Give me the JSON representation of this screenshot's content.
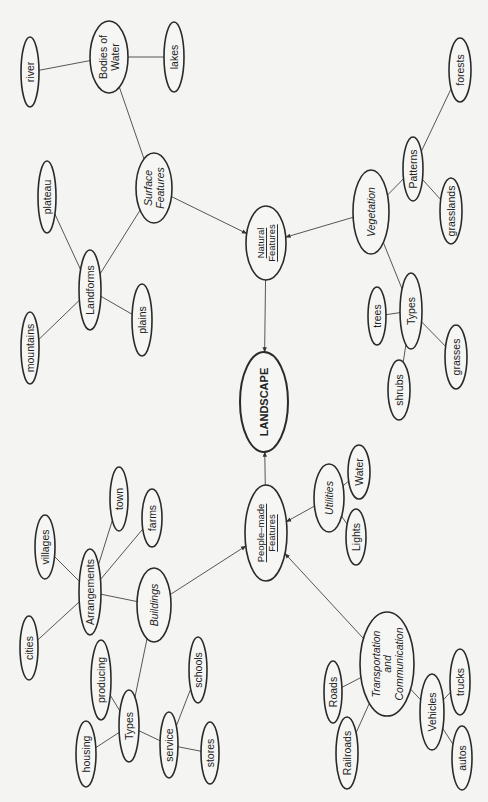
{
  "diagram": {
    "type": "concept-map",
    "root": "landscape",
    "nodes": [
      {
        "id": "landscape",
        "label": [
          "LANDSCAPE"
        ],
        "style": "bold",
        "cx": 264,
        "cy": 402,
        "rx": 24,
        "ry": 50
      },
      {
        "id": "natural",
        "label": [
          "Natural",
          "Features"
        ],
        "style": "sc",
        "cx": 266,
        "cy": 243,
        "rx": 20,
        "ry": 37
      },
      {
        "id": "peoplemade",
        "label": [
          "People–made",
          "Features"
        ],
        "style": "sc",
        "cx": 266,
        "cy": 533,
        "rx": 21,
        "ry": 48
      },
      {
        "id": "surface",
        "label": [
          "Surface",
          "Features"
        ],
        "style": "italic",
        "cx": 154,
        "cy": 188,
        "rx": 18,
        "ry": 35
      },
      {
        "id": "bodies",
        "label": [
          "Bodies of",
          "Water"
        ],
        "style": "normal",
        "cx": 109,
        "cy": 57,
        "rx": 19,
        "ry": 36
      },
      {
        "id": "river",
        "label": [
          "river"
        ],
        "style": "normal",
        "cx": 30,
        "cy": 72,
        "rx": 9,
        "ry": 35
      },
      {
        "id": "lakes",
        "label": [
          "lakes"
        ],
        "style": "normal",
        "cx": 174,
        "cy": 57,
        "rx": 10,
        "ry": 35
      },
      {
        "id": "landforms",
        "label": [
          "Landforms"
        ],
        "style": "normal",
        "cx": 90,
        "cy": 290,
        "rx": 11,
        "ry": 40
      },
      {
        "id": "plateau",
        "label": [
          "plateau"
        ],
        "style": "normal",
        "cx": 47,
        "cy": 197,
        "rx": 9,
        "ry": 36
      },
      {
        "id": "mountains",
        "label": [
          "mountains"
        ],
        "style": "normal",
        "cx": 30,
        "cy": 348,
        "rx": 9,
        "ry": 36
      },
      {
        "id": "plains",
        "label": [
          "plains"
        ],
        "style": "normal",
        "cx": 142,
        "cy": 320,
        "rx": 10,
        "ry": 36
      },
      {
        "id": "vegetation",
        "label": [
          "Vegetation"
        ],
        "style": "italic",
        "cx": 371,
        "cy": 212,
        "rx": 18,
        "ry": 42
      },
      {
        "id": "patterns",
        "label": [
          "Patterns"
        ],
        "style": "normal",
        "cx": 413,
        "cy": 169,
        "rx": 10,
        "ry": 32
      },
      {
        "id": "forests",
        "label": [
          "forests"
        ],
        "style": "normal",
        "cx": 460,
        "cy": 70,
        "rx": 11,
        "ry": 32
      },
      {
        "id": "grasslands",
        "label": [
          "grasslands"
        ],
        "style": "normal",
        "cx": 451,
        "cy": 211,
        "rx": 11,
        "ry": 33
      },
      {
        "id": "vegtypes",
        "label": [
          "Types"
        ],
        "style": "normal",
        "cx": 411,
        "cy": 311,
        "rx": 11,
        "ry": 38
      },
      {
        "id": "trees",
        "label": [
          "trees"
        ],
        "style": "normal",
        "cx": 377,
        "cy": 316,
        "rx": 9,
        "ry": 29
      },
      {
        "id": "grasses",
        "label": [
          "grasses"
        ],
        "style": "normal",
        "cx": 456,
        "cy": 357,
        "rx": 11,
        "ry": 32
      },
      {
        "id": "shrubs",
        "label": [
          "shrubs"
        ],
        "style": "normal",
        "cx": 399,
        "cy": 390,
        "rx": 11,
        "ry": 30
      },
      {
        "id": "utilities",
        "label": [
          "Utilities"
        ],
        "style": "italic",
        "cx": 329,
        "cy": 498,
        "rx": 15,
        "ry": 34
      },
      {
        "id": "water",
        "label": [
          "Water"
        ],
        "style": "normal",
        "cx": 359,
        "cy": 472,
        "rx": 11,
        "ry": 27
      },
      {
        "id": "lights",
        "label": [
          "Lights"
        ],
        "style": "normal",
        "cx": 356,
        "cy": 537,
        "rx": 10,
        "ry": 28
      },
      {
        "id": "buildings",
        "label": [
          "Buildings"
        ],
        "style": "italic",
        "cx": 154,
        "cy": 605,
        "rx": 17,
        "ry": 37
      },
      {
        "id": "arrangements",
        "label": [
          "Arrangements"
        ],
        "style": "normal",
        "cx": 90,
        "cy": 592,
        "rx": 11,
        "ry": 43
      },
      {
        "id": "villages",
        "label": [
          "villages"
        ],
        "style": "normal",
        "cx": 45,
        "cy": 547,
        "rx": 10,
        "ry": 32
      },
      {
        "id": "town",
        "label": [
          "town"
        ],
        "style": "normal",
        "cx": 119,
        "cy": 499,
        "rx": 9,
        "ry": 32
      },
      {
        "id": "farms",
        "label": [
          "farms"
        ],
        "style": "normal",
        "cx": 152,
        "cy": 518,
        "rx": 10,
        "ry": 29
      },
      {
        "id": "cities",
        "label": [
          "cities"
        ],
        "style": "normal",
        "cx": 29,
        "cy": 648,
        "rx": 9,
        "ry": 32
      },
      {
        "id": "bldtypes",
        "label": [
          "Types"
        ],
        "style": "normal",
        "cx": 129,
        "cy": 726,
        "rx": 10,
        "ry": 36
      },
      {
        "id": "producing",
        "label": [
          "producing"
        ],
        "style": "normal",
        "cx": 101,
        "cy": 680,
        "rx": 10,
        "ry": 40
      },
      {
        "id": "housing",
        "label": [
          "housing"
        ],
        "style": "normal",
        "cx": 86,
        "cy": 754,
        "rx": 10,
        "ry": 33
      },
      {
        "id": "service",
        "label": [
          "service"
        ],
        "style": "normal",
        "cx": 169,
        "cy": 745,
        "rx": 9,
        "ry": 33
      },
      {
        "id": "schools",
        "label": [
          "schools"
        ],
        "style": "normal",
        "cx": 198,
        "cy": 670,
        "rx": 9,
        "ry": 33
      },
      {
        "id": "stores",
        "label": [
          "stores"
        ],
        "style": "normal",
        "cx": 210,
        "cy": 753,
        "rx": 9,
        "ry": 31
      },
      {
        "id": "transport",
        "label": [
          "Transportation",
          "and",
          "Communication"
        ],
        "style": "italic",
        "cx": 387,
        "cy": 664,
        "rx": 27,
        "ry": 52
      },
      {
        "id": "roads",
        "label": [
          "Roads"
        ],
        "style": "normal",
        "cx": 333,
        "cy": 692,
        "rx": 9,
        "ry": 31
      },
      {
        "id": "railroads",
        "label": [
          "Railroads"
        ],
        "style": "normal",
        "cx": 347,
        "cy": 753,
        "rx": 11,
        "ry": 36
      },
      {
        "id": "vehicles",
        "label": [
          "Vehicles"
        ],
        "style": "normal",
        "cx": 432,
        "cy": 712,
        "rx": 12,
        "ry": 38
      },
      {
        "id": "trucks",
        "label": [
          "trucks"
        ],
        "style": "normal",
        "cx": 460,
        "cy": 682,
        "rx": 10,
        "ry": 33
      },
      {
        "id": "autos",
        "label": [
          "autos"
        ],
        "style": "normal",
        "cx": 462,
        "cy": 758,
        "rx": 10,
        "ry": 32
      }
    ],
    "edges": [
      {
        "from": "natural",
        "to": "landscape",
        "arrow": true
      },
      {
        "from": "peoplemade",
        "to": "landscape",
        "arrow": true
      },
      {
        "from": "surface",
        "to": "natural",
        "arrow": true
      },
      {
        "from": "vegetation",
        "to": "natural",
        "arrow": true
      },
      {
        "from": "utilities",
        "to": "peoplemade",
        "arrow": true
      },
      {
        "from": "buildings",
        "to": "peoplemade",
        "arrow": true
      },
      {
        "from": "transport",
        "to": "peoplemade",
        "arrow": true
      },
      {
        "from": "surface",
        "to": "bodies",
        "arrow": false
      },
      {
        "from": "bodies",
        "to": "river",
        "arrow": false
      },
      {
        "from": "bodies",
        "to": "lakes",
        "arrow": false
      },
      {
        "from": "surface",
        "to": "landforms",
        "arrow": false
      },
      {
        "from": "landforms",
        "to": "plateau",
        "arrow": false
      },
      {
        "from": "landforms",
        "to": "mountains",
        "arrow": false
      },
      {
        "from": "landforms",
        "to": "plains",
        "arrow": false
      },
      {
        "from": "vegetation",
        "to": "patterns",
        "arrow": false
      },
      {
        "from": "patterns",
        "to": "forests",
        "arrow": false
      },
      {
        "from": "patterns",
        "to": "grasslands",
        "arrow": false
      },
      {
        "from": "vegetation",
        "to": "vegtypes",
        "arrow": false
      },
      {
        "from": "vegtypes",
        "to": "trees",
        "arrow": false
      },
      {
        "from": "vegtypes",
        "to": "grasses",
        "arrow": false
      },
      {
        "from": "vegtypes",
        "to": "shrubs",
        "arrow": false
      },
      {
        "from": "utilities",
        "to": "water",
        "arrow": false
      },
      {
        "from": "utilities",
        "to": "lights",
        "arrow": false
      },
      {
        "from": "buildings",
        "to": "arrangements",
        "arrow": false
      },
      {
        "from": "arrangements",
        "to": "villages",
        "arrow": false
      },
      {
        "from": "arrangements",
        "to": "town",
        "arrow": false
      },
      {
        "from": "arrangements",
        "to": "farms",
        "arrow": false
      },
      {
        "from": "arrangements",
        "to": "cities",
        "arrow": false
      },
      {
        "from": "buildings",
        "to": "bldtypes",
        "arrow": false
      },
      {
        "from": "bldtypes",
        "to": "producing",
        "arrow": false
      },
      {
        "from": "bldtypes",
        "to": "housing",
        "arrow": false
      },
      {
        "from": "bldtypes",
        "to": "service",
        "arrow": false
      },
      {
        "from": "service",
        "to": "schools",
        "arrow": false
      },
      {
        "from": "service",
        "to": "stores",
        "arrow": false
      },
      {
        "from": "transport",
        "to": "roads",
        "arrow": false
      },
      {
        "from": "transport",
        "to": "railroads",
        "arrow": false
      },
      {
        "from": "transport",
        "to": "vehicles",
        "arrow": false
      },
      {
        "from": "vehicles",
        "to": "trucks",
        "arrow": false
      },
      {
        "from": "vehicles",
        "to": "autos",
        "arrow": false
      }
    ]
  },
  "colors": {
    "background": "#f4f4f2",
    "node_fill": "#f6f6f4",
    "stroke": "#2a2a2a",
    "text": "#222222"
  }
}
